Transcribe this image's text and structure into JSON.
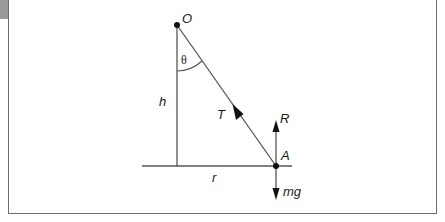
{
  "figure": {
    "type": "free-body diagram",
    "labels": {
      "pivot": "O",
      "angle": "θ",
      "height": "h",
      "tension": "T",
      "reaction": "R",
      "point": "A",
      "radius": "r",
      "weight": "mg"
    },
    "colors": {
      "line": "#555555",
      "ink": "#111111",
      "frame": "#6f6f6f",
      "tab": "#9a9a9a",
      "background": "#ffffff"
    }
  }
}
